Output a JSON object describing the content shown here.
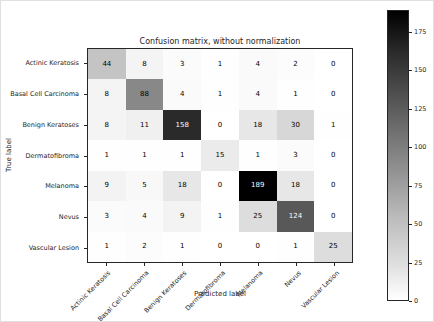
{
  "chart_data": {
    "type": "heatmap",
    "title": "Confusion matrix, without normalization",
    "xlabel": "Predicted label",
    "ylabel": "True label",
    "categories": [
      "Actinic Keratosis",
      "Basal Cell Carcinoma",
      "Benign Keratoses",
      "Dermatofibroma",
      "Melanoma",
      "Nevus",
      "Vascular Lesion"
    ],
    "matrix": [
      [
        44,
        8,
        3,
        1,
        4,
        2,
        0
      ],
      [
        8,
        88,
        4,
        1,
        4,
        1,
        0
      ],
      [
        8,
        11,
        158,
        0,
        18,
        30,
        1
      ],
      [
        1,
        1,
        1,
        15,
        1,
        3,
        0
      ],
      [
        9,
        5,
        18,
        0,
        189,
        18,
        0
      ],
      [
        3,
        4,
        9,
        1,
        25,
        124,
        0
      ],
      [
        1,
        2,
        1,
        0,
        0,
        1,
        25
      ]
    ],
    "vmin": 0,
    "vmax": 189,
    "colormap": "Greys",
    "colorbar_ticks": [
      0,
      25,
      50,
      75,
      100,
      125,
      150,
      175
    ],
    "colorbar_position": "right",
    "grid": false,
    "text_colors": {
      "light_cell_text": "#000000",
      "dark_cell_text": "#ffffff"
    }
  }
}
